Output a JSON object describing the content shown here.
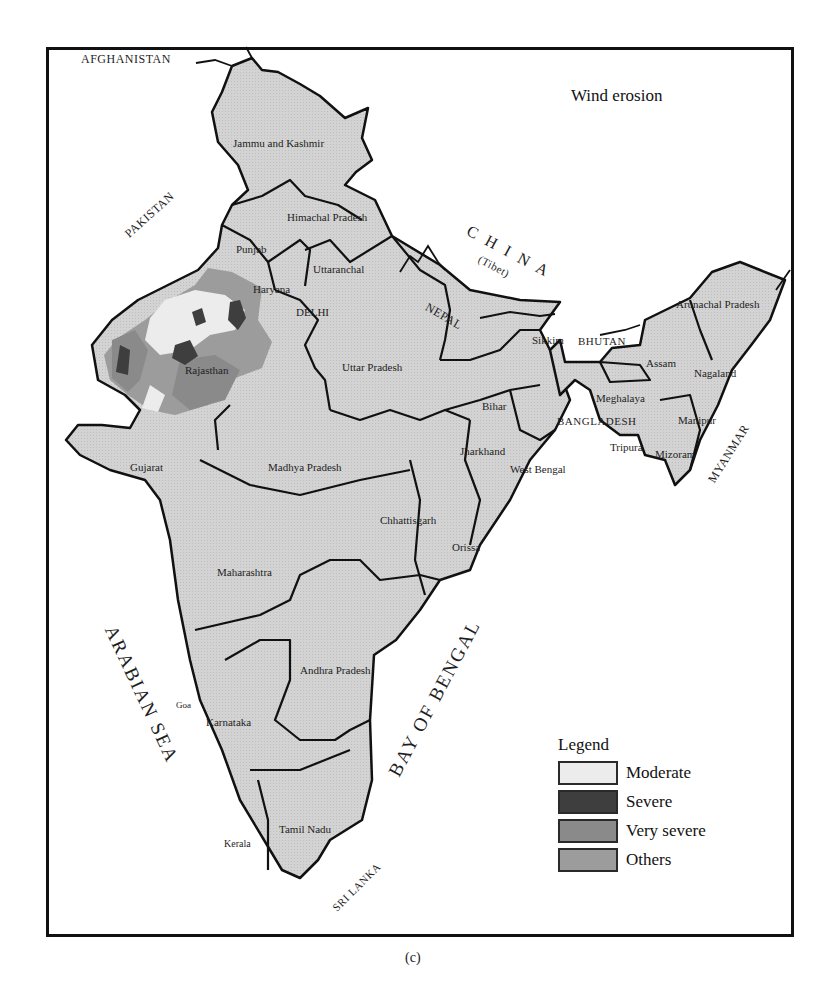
{
  "map": {
    "title": "Wind erosion",
    "caption": "(c)",
    "colors": {
      "land": "#d3d3d3",
      "border": "#111111",
      "moderate": "#ececec",
      "severe": "#3e3e3e",
      "very_severe": "#8a8a8a",
      "others": "#9c9c9c"
    },
    "countries": {
      "afghanistan": "AFGHANISTAN",
      "pakistan": "PAKISTAN",
      "china": "C H I N A",
      "tibet": "(Tibet)",
      "nepal": "NEPAL",
      "bhutan": "BHUTAN",
      "bangladesh": "BANGLADESH",
      "myanmar": "MYANMAR",
      "sri_lanka": "SRI LANKA"
    },
    "seas": {
      "arabian_sea": "ARABIAN SEA",
      "bay_of_bengal": "BAY OF BENGAL"
    },
    "states": {
      "jammu_kashmir": "Jammu and Kashmir",
      "himachal": "Himachal Pradesh",
      "punjab": "Punjab",
      "uttaranchal": "Uttaranchal",
      "haryana": "Haryana",
      "delhi": "DELHI",
      "rajasthan": "Rajasthan",
      "uttar_pradesh": "Uttar Pradesh",
      "bihar": "Bihar",
      "sikkim": "Sikkim",
      "arunachal": "Arunachal Pradesh",
      "assam": "Assam",
      "nagaland": "Nagaland",
      "meghalaya": "Meghalaya",
      "manipur": "Manipur",
      "tripura": "Tripura",
      "mizoram": "Mizoram",
      "jharkhand": "Jharkhand",
      "west_bengal": "West Bengal",
      "gujarat": "Gujarat",
      "madhya_pradesh": "Madhya Pradesh",
      "chhattisgarh": "Chhattisgarh",
      "orissa": "Orissa",
      "maharashtra": "Maharashtra",
      "andhra_pradesh": "Andhra Pradesh",
      "goa": "Goa",
      "karnataka": "Karnataka",
      "tamil_nadu": "Tamil Nadu",
      "kerala": "Kerala"
    },
    "legend": {
      "title": "Legend",
      "items": [
        {
          "label": "Moderate",
          "color": "#ececec"
        },
        {
          "label": "Severe",
          "color": "#3e3e3e"
        },
        {
          "label": "Very severe",
          "color": "#8a8a8a"
        },
        {
          "label": "Others",
          "color": "#9c9c9c"
        }
      ]
    }
  }
}
